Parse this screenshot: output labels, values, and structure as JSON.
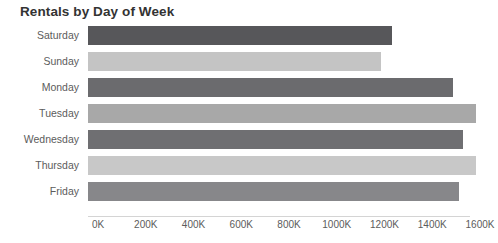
{
  "chart_data": {
    "type": "bar",
    "orientation": "horizontal",
    "title": "Rentals by Day of Week",
    "xlabel": "",
    "ylabel": "",
    "categories": [
      "Saturday",
      "Sunday",
      "Monday",
      "Tuesday",
      "Wednesday",
      "Thursday",
      "Friday"
    ],
    "values": [
      1275000,
      1228000,
      1530000,
      1625000,
      1570000,
      1625000,
      1556000
    ],
    "value_labels": [
      "1275K",
      "1228K",
      "1530K",
      "1625K",
      "1570K",
      "1625K",
      "1556K"
    ],
    "bar_colors": [
      "#57575a",
      "#c4c4c4",
      "#6b6b6e",
      "#a8a8a8",
      "#6f6f72",
      "#c8c8c8",
      "#87878a"
    ],
    "xlim": [
      0,
      1600000
    ],
    "xticks": [
      0,
      200000,
      400000,
      600000,
      800000,
      1000000,
      1200000,
      1400000,
      1600000
    ],
    "xtick_labels": [
      "0K",
      "200K",
      "400K",
      "600K",
      "800K",
      "1000K",
      "1200K",
      "1400K",
      "1600K"
    ],
    "grid": false,
    "legend": null
  }
}
